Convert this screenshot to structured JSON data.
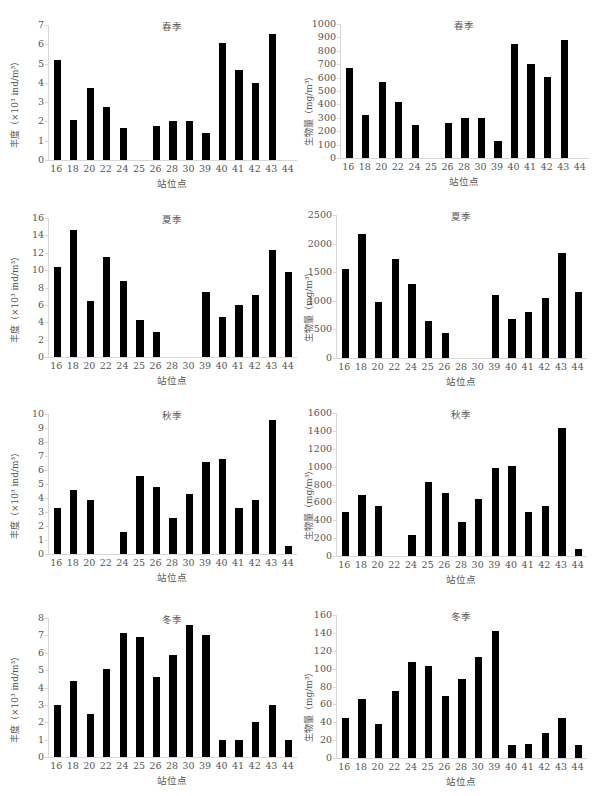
{
  "chart_data": [
    {
      "type": "bar",
      "title": "春季",
      "xlabel": "站位点",
      "ylabel": "丰度（×10³ ind/m³）",
      "categories": [
        "16",
        "18",
        "20",
        "22",
        "24",
        "25",
        "26",
        "28",
        "30",
        "39",
        "40",
        "41",
        "42",
        "43",
        "44"
      ],
      "values": [
        5.2,
        2.1,
        3.75,
        2.75,
        1.65,
        0,
        1.75,
        2.0,
        2.0,
        1.4,
        6.05,
        4.65,
        4.0,
        6.55,
        0
      ],
      "ylim": [
        0,
        7
      ],
      "yticks": [
        0,
        1,
        2,
        3,
        4,
        5,
        6,
        7
      ],
      "grid": false
    },
    {
      "type": "bar",
      "title": "春季",
      "xlabel": "站位点",
      "ylabel": "生物量（mg/m³）",
      "categories": [
        "16",
        "18",
        "20",
        "22",
        "24",
        "25",
        "26",
        "28",
        "30",
        "39",
        "40",
        "41",
        "42",
        "43",
        "44"
      ],
      "values": [
        675,
        320,
        565,
        415,
        245,
        0,
        265,
        300,
        300,
        130,
        850,
        700,
        605,
        880,
        0
      ],
      "ylim": [
        0,
        1000
      ],
      "yticks": [
        0,
        100,
        200,
        300,
        400,
        500,
        600,
        700,
        800,
        900,
        1000
      ],
      "grid": false
    },
    {
      "type": "bar",
      "title": "夏季",
      "xlabel": "站位点",
      "ylabel": "丰度（×10³ ind/m³）",
      "categories": [
        "16",
        "18",
        "20",
        "22",
        "24",
        "25",
        "26",
        "28",
        "30",
        "39",
        "40",
        "41",
        "42",
        "43",
        "44"
      ],
      "values": [
        10.4,
        14.6,
        6.5,
        11.5,
        8.7,
        4.3,
        2.9,
        0,
        0,
        7.5,
        4.6,
        6.0,
        7.1,
        12.3,
        9.8
      ],
      "ylim": [
        0,
        16
      ],
      "yticks": [
        0,
        2,
        4,
        6,
        8,
        10,
        12,
        14,
        16
      ],
      "grid": false
    },
    {
      "type": "bar",
      "title": "夏季",
      "xlabel": "站位点",
      "ylabel": "生物量（mg/m³）",
      "categories": [
        "16",
        "18",
        "20",
        "22",
        "24",
        "25",
        "26",
        "28",
        "30",
        "39",
        "40",
        "41",
        "42",
        "43",
        "44"
      ],
      "values": [
        1550,
        2170,
        980,
        1730,
        1290,
        640,
        430,
        0,
        0,
        1100,
        690,
        800,
        1050,
        1840,
        1160
      ],
      "ylim": [
        0,
        2500
      ],
      "yticks": [
        0,
        500,
        1000,
        1500,
        2000,
        2500
      ],
      "grid": false
    },
    {
      "type": "bar",
      "title": "秋季",
      "xlabel": "站位点",
      "ylabel": "丰度（×10³ ind/m³）",
      "categories": [
        "16",
        "18",
        "20",
        "22",
        "24",
        "25",
        "26",
        "28",
        "30",
        "39",
        "40",
        "41",
        "42",
        "43",
        "44"
      ],
      "values": [
        3.3,
        4.55,
        3.85,
        0,
        1.55,
        5.55,
        4.8,
        2.6,
        4.3,
        6.55,
        6.8,
        3.3,
        3.85,
        9.6,
        0.6
      ],
      "ylim": [
        0,
        10
      ],
      "yticks": [
        0,
        1,
        2,
        3,
        4,
        5,
        6,
        7,
        8,
        9,
        10
      ],
      "grid": false
    },
    {
      "type": "bar",
      "title": "秋季",
      "xlabel": "站位点",
      "ylabel": "生物量（mg/m³）",
      "categories": [
        "16",
        "18",
        "20",
        "22",
        "24",
        "25",
        "26",
        "28",
        "30",
        "39",
        "40",
        "41",
        "42",
        "43",
        "44"
      ],
      "values": [
        490,
        680,
        560,
        0,
        230,
        830,
        710,
        380,
        640,
        980,
        1010,
        490,
        560,
        1430,
        80
      ],
      "ylim": [
        0,
        1600
      ],
      "yticks": [
        0,
        200,
        400,
        600,
        800,
        1000,
        1200,
        1400,
        1600
      ],
      "grid": false
    },
    {
      "type": "bar",
      "title": "冬季",
      "xlabel": "站位点",
      "ylabel": "丰度（×10³ ind/m³）",
      "categories": [
        "16",
        "18",
        "20",
        "22",
        "24",
        "25",
        "26",
        "28",
        "30",
        "39",
        "40",
        "41",
        "42",
        "43",
        "44"
      ],
      "values": [
        3.0,
        4.4,
        2.5,
        5.05,
        7.15,
        6.9,
        4.6,
        5.85,
        7.6,
        7.0,
        1.0,
        1.0,
        2.0,
        3.0,
        1.0
      ],
      "ylim": [
        0,
        8
      ],
      "yticks": [
        0,
        1,
        2,
        3,
        4,
        5,
        6,
        7,
        8
      ],
      "grid": false
    },
    {
      "type": "bar",
      "title": "冬季",
      "xlabel": "站位点",
      "ylabel": "生物量（mg/m³）",
      "categories": [
        "16",
        "18",
        "20",
        "22",
        "24",
        "25",
        "26",
        "28",
        "30",
        "39",
        "40",
        "41",
        "42",
        "43",
        "44"
      ],
      "values": [
        45,
        66,
        38,
        75,
        107,
        103,
        69,
        88,
        113,
        142,
        15,
        16,
        28,
        45,
        15
      ],
      "ylim": [
        0,
        160
      ],
      "yticks": [
        0,
        20,
        40,
        60,
        80,
        100,
        120,
        140,
        160
      ],
      "grid": false
    }
  ],
  "layout": {
    "panels": [
      {
        "left": 0,
        "top": 0,
        "plot": {
          "x": 48,
          "y": 25,
          "w": 248,
          "h": 135
        }
      },
      {
        "left": 300,
        "top": 0,
        "plot": {
          "x": 40,
          "y": 24,
          "w": 248,
          "h": 134
        }
      },
      {
        "left": 0,
        "top": 199,
        "plot": {
          "x": 48,
          "y": 19,
          "w": 248,
          "h": 139
        }
      },
      {
        "left": 300,
        "top": 199,
        "plot": {
          "x": 36,
          "y": 16,
          "w": 250,
          "h": 143
        }
      },
      {
        "left": 0,
        "top": 398,
        "plot": {
          "x": 48,
          "y": 16,
          "w": 248,
          "h": 140
        }
      },
      {
        "left": 300,
        "top": 398,
        "plot": {
          "x": 36,
          "y": 15,
          "w": 250,
          "h": 143
        }
      },
      {
        "left": 0,
        "top": 597,
        "plot": {
          "x": 48,
          "y": 21,
          "w": 248,
          "h": 139
        }
      },
      {
        "left": 300,
        "top": 597,
        "plot": {
          "x": 36,
          "y": 18,
          "w": 250,
          "h": 143
        }
      }
    ]
  }
}
